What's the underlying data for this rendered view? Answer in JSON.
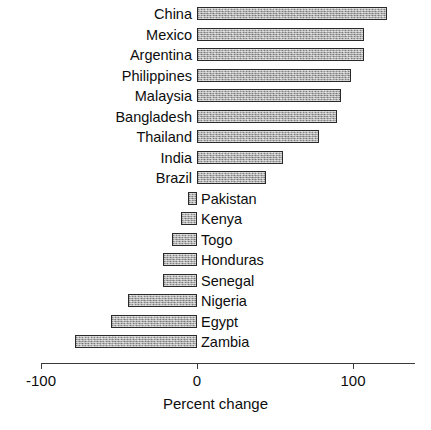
{
  "chart_data": {
    "type": "bar",
    "orientation": "horizontal",
    "title": "",
    "subtitle": "",
    "xlabel": "Percent change",
    "ylabel": "",
    "xlim": [
      -100,
      140
    ],
    "xticks": [
      -100,
      0,
      100
    ],
    "xticklabels": [
      "-100",
      "0",
      "100"
    ],
    "grid": false,
    "legend": false,
    "categories": [
      "China",
      "Mexico",
      "Argentina",
      "Philippines",
      "Malaysia",
      "Bangladesh",
      "Thailand",
      "India",
      "Brazil",
      "Pakistan",
      "Kenya",
      "Togo",
      "Honduras",
      "Senegal",
      "Nigeria",
      "Egypt",
      "Zambia"
    ],
    "values": [
      122,
      107,
      107,
      99,
      92,
      90,
      78,
      55,
      44,
      -6,
      -10,
      -16,
      -22,
      -22,
      -44,
      -55,
      -78
    ],
    "bar_color": "#a8a8a8",
    "bar_edge_color": "#2a2a2a",
    "axis_color": "#3a3a3a"
  },
  "axis": {
    "title": "Percent change",
    "ticks": [
      {
        "label": "-100",
        "value": -100
      },
      {
        "label": "0",
        "value": 0
      },
      {
        "label": "100",
        "value": 100
      }
    ]
  }
}
